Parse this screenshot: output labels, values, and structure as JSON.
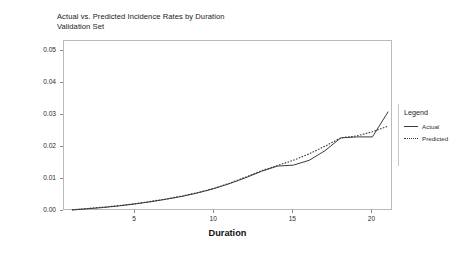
{
  "chart_data": {
    "type": "line",
    "title": "Actual vs. Predicted Incidence Rates by Duration",
    "subtitle": "Validation Set",
    "xlabel": "Duration",
    "ylabel": "Incidence Rate",
    "xlim": [
      0.5,
      21.3
    ],
    "ylim": [
      0.0,
      0.053
    ],
    "grid": false,
    "legend_title": "Legend",
    "legend_position": "right",
    "xticks": [
      5,
      10,
      15,
      20
    ],
    "xtick_labels": [
      "5",
      "10",
      "15",
      "20"
    ],
    "yticks": [
      0.0,
      0.01,
      0.02,
      0.03,
      0.04,
      0.05
    ],
    "ytick_labels": [
      "0.00",
      "0.01",
      "0.02",
      "0.03",
      "0.04",
      "0.05"
    ],
    "x": [
      1,
      2,
      3,
      4,
      5,
      6,
      7,
      8,
      9,
      10,
      11,
      12,
      13,
      14,
      15,
      16,
      17,
      18,
      19,
      20,
      21
    ],
    "series": [
      {
        "name": "Actual",
        "style": "solid",
        "color": "#3a3a3a",
        "values": [
          0.0003,
          0.0007,
          0.0011,
          0.0016,
          0.0022,
          0.0029,
          0.0037,
          0.0046,
          0.0057,
          0.007,
          0.0086,
          0.0104,
          0.0124,
          0.014,
          0.0143,
          0.0158,
          0.0188,
          0.0228,
          0.0231,
          0.0231,
          0.031
        ]
      },
      {
        "name": "Predicted",
        "style": "dotted",
        "color": "#3a3a3a",
        "values": [
          0.0004,
          0.0008,
          0.0012,
          0.0017,
          0.0023,
          0.003,
          0.0038,
          0.0047,
          0.0058,
          0.0071,
          0.0087,
          0.0106,
          0.0126,
          0.0142,
          0.0158,
          0.0178,
          0.0202,
          0.0228,
          0.0234,
          0.0247,
          0.0265
        ]
      }
    ]
  },
  "legend": {
    "title": "Legend",
    "entries": [
      {
        "label": "Actual",
        "style": "solid"
      },
      {
        "label": "Predicted",
        "style": "dotted"
      }
    ]
  }
}
